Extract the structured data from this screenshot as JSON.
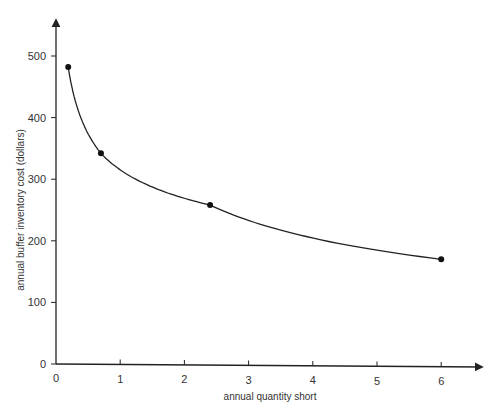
{
  "chart_data": {
    "type": "line",
    "title": "",
    "xlabel": "annual quantity short",
    "ylabel": "annual buffer inventory cost (dollars)",
    "xlim": [
      0,
      6.6
    ],
    "ylim": [
      0,
      560
    ],
    "x_ticks": [
      "0",
      "1",
      "2",
      "3",
      "4",
      "5",
      "6"
    ],
    "y_ticks": [
      "0",
      "100",
      "200",
      "300",
      "400",
      "500"
    ],
    "grid": false,
    "legend": null,
    "series": [
      {
        "name": "buffer cost curve",
        "x": [
          0.19,
          0.7,
          2.4,
          6.0
        ],
        "y": [
          482,
          342,
          258,
          170
        ],
        "markers": true,
        "smooth": true
      }
    ]
  },
  "colors": {
    "line": "#222222",
    "axis": "#222222",
    "text": "#333333"
  }
}
